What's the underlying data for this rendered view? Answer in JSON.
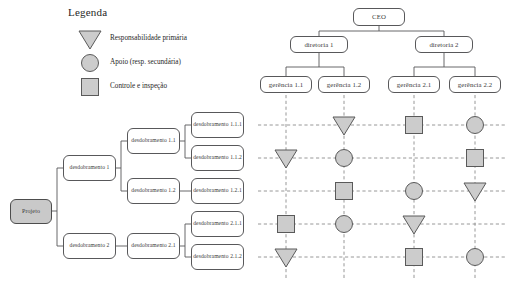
{
  "legend": {
    "title": "Legenda",
    "items": [
      {
        "symbol": "triangle",
        "label": "Responsabilidade primária"
      },
      {
        "symbol": "circle",
        "label": "Apoio (resp. secundária)"
      },
      {
        "symbol": "square",
        "label": "Controle e inspeção"
      }
    ]
  },
  "org_chart": {
    "root": {
      "label": "CEO"
    },
    "level2": [
      {
        "label": "diretoria 1"
      },
      {
        "label": "diretoria 2"
      }
    ],
    "level3": [
      {
        "label": "gerência 1.1"
      },
      {
        "label": "gerência 1.2"
      },
      {
        "label": "gerência 2.1"
      },
      {
        "label": "gerência 2.2"
      }
    ]
  },
  "wbs": {
    "root": {
      "label": "Projeto"
    },
    "level2": [
      {
        "label": "desdobramento 1"
      },
      {
        "label": "desdobramento 2"
      }
    ],
    "level3": [
      {
        "label": "desdobramento 1.1"
      },
      {
        "label": "desdobramento 1.2"
      },
      {
        "label": "desdobramento 2.1"
      }
    ],
    "level4": [
      {
        "label": "desdobramento 1.1.1"
      },
      {
        "label": "desdobramento 1.1.2"
      },
      {
        "label": "desdobramento 1.2.1"
      },
      {
        "label": "desdobramento 2.1.1"
      },
      {
        "label": "desdobramento 2.1.2"
      }
    ]
  },
  "matrix": {
    "columns": [
      "gerência 1.1",
      "gerência 1.2",
      "gerência 2.1",
      "gerência 2.2"
    ],
    "rows": [
      {
        "task": "desdobramento 1.1.1",
        "cells": [
          null,
          "triangle",
          "square",
          "circle"
        ]
      },
      {
        "task": "desdobramento 1.1.2",
        "cells": [
          "triangle",
          "circle",
          null,
          "square"
        ]
      },
      {
        "task": "desdobramento 1.2.1",
        "cells": [
          null,
          "square",
          "circle",
          "triangle"
        ]
      },
      {
        "task": "desdobramento 2.1.1",
        "cells": [
          "square",
          "circle",
          "triangle",
          null
        ]
      },
      {
        "task": "desdobramento 2.1.2",
        "cells": [
          "triangle",
          null,
          "square",
          "circle"
        ]
      }
    ]
  },
  "colors": {
    "symbol_fill": "#cccccc",
    "symbol_stroke": "#5a5a5a",
    "node_stroke": "#58585a",
    "filled_node": "#c9c9c9",
    "dash_line": "#8c8c8c"
  }
}
